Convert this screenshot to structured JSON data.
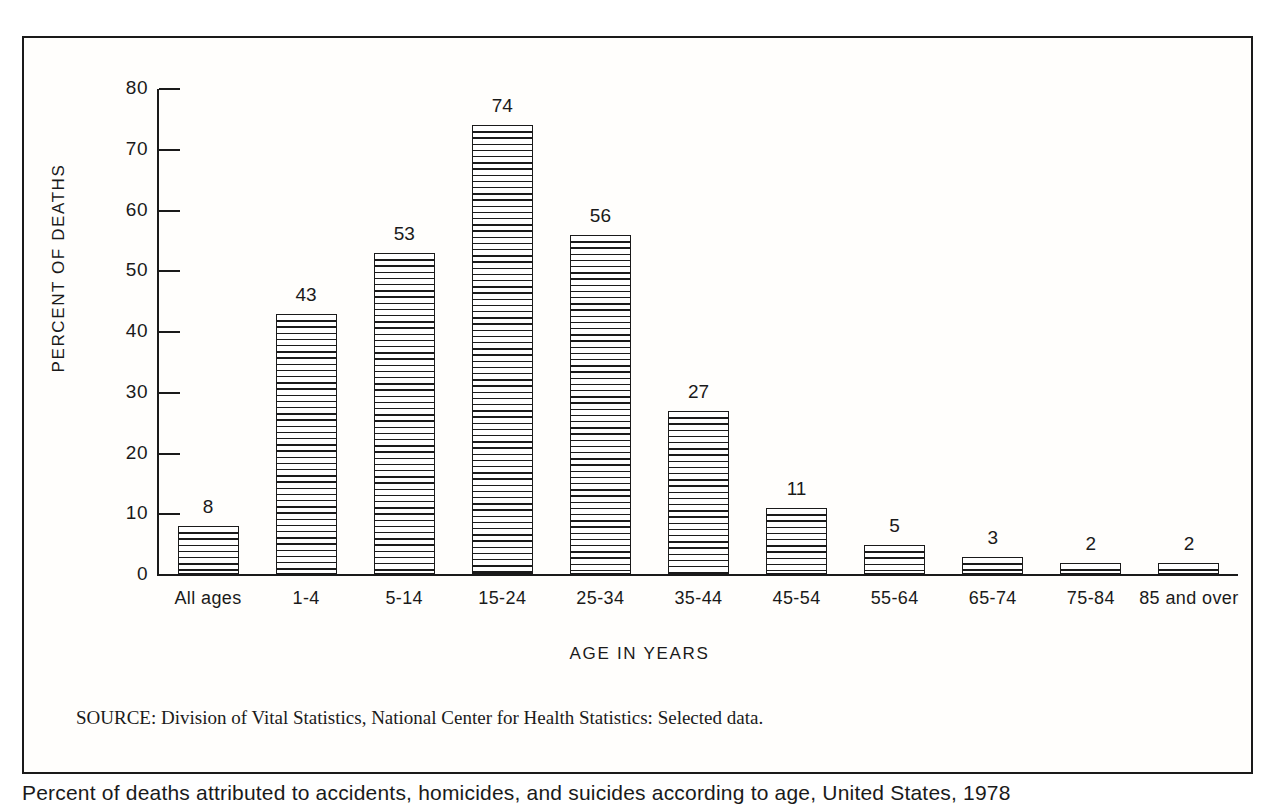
{
  "chart_data": {
    "type": "bar",
    "title": "",
    "xlabel": "AGE IN YEARS",
    "ylabel": "PERCENT OF DEATHS",
    "categories": [
      "All ages",
      "1-4",
      "5-14",
      "15-24",
      "25-34",
      "35-44",
      "45-54",
      "55-64",
      "65-74",
      "75-84",
      "85 and over"
    ],
    "values": [
      8,
      43,
      53,
      74,
      56,
      27,
      11,
      5,
      3,
      2,
      2
    ],
    "value_labels": [
      "8",
      "43",
      "53",
      "74",
      "56",
      "27",
      "11",
      "5",
      "3",
      "2",
      "2"
    ],
    "ylim": [
      0,
      80
    ],
    "ytick_values": [
      0,
      10,
      20,
      30,
      40,
      50,
      60,
      70,
      80
    ],
    "ytick_labels": [
      "0",
      "10",
      "20",
      "30",
      "40",
      "50",
      "60",
      "70",
      "80"
    ],
    "grid": false,
    "legend": false,
    "bar_fill": "horizontal-line-hatch",
    "colors": {
      "ink": "#1a1a1a",
      "paper": "#ffffff"
    }
  },
  "notes": {
    "source": "SOURCE: Division of Vital Statistics, National Center for Health Statistics: Selected data."
  },
  "caption": {
    "text": "Percent of deaths attributed to accidents, homicides, and suicides according to age, United States, 1978"
  }
}
